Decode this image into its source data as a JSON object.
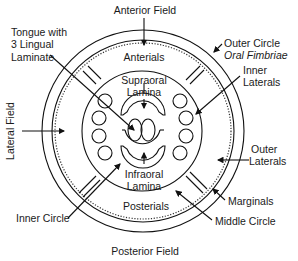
{
  "diagram": {
    "fields": {
      "anterior": "Anterior Field",
      "posterior": "Posterior Field",
      "lateral": "Lateral Field"
    },
    "regions": {
      "anterials": "Anterials",
      "posterials": "Posterials",
      "supraoral_1": "Supraoral",
      "supraoral_2": "Lamina",
      "infraoral_1": "Infraoral",
      "infraoral_2": "Lamina"
    },
    "callouts": {
      "tongue_1": "Tongue with",
      "tongue_2": "3 Lingual",
      "tongue_3": "Laminate",
      "outer_circle_1": "Outer Circle",
      "outer_circle_2": "Oral Fimbriae",
      "inner_laterals_1": "Inner",
      "inner_laterals_2": "Laterals",
      "outer_laterals_1": "Outer",
      "outer_laterals_2": "Laterals",
      "marginals": "Marginals",
      "middle_circle": "Middle Circle",
      "inner_circle": "Inner Circle"
    },
    "colors": {
      "stroke": "#111111",
      "background": "#ffffff"
    }
  }
}
